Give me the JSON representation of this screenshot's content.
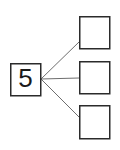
{
  "diagram": {
    "type": "number-bond-tree",
    "background_color": "#ffffff",
    "stroke_color": "#2b2b2b",
    "connector_color": "#6e6e6e",
    "text_color": "#1a1a1a",
    "root": {
      "label": "5",
      "x": 10,
      "y": 63,
      "width": 31,
      "height": 33,
      "font_size": 26
    },
    "children": [
      {
        "label": "",
        "x": 79,
        "y": 16,
        "width": 31,
        "height": 33
      },
      {
        "label": "",
        "x": 79,
        "y": 61,
        "width": 31,
        "height": 33
      },
      {
        "label": "",
        "x": 79,
        "y": 105,
        "width": 31,
        "height": 34
      }
    ],
    "connectors": [
      {
        "x1": 41,
        "y1": 79,
        "x2": 79,
        "y2": 42
      },
      {
        "x1": 41,
        "y1": 79,
        "x2": 79,
        "y2": 78
      },
      {
        "x1": 41,
        "y1": 79,
        "x2": 79,
        "y2": 117
      }
    ]
  }
}
